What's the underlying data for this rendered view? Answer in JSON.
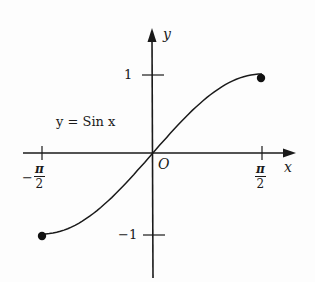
{
  "chart_data": {
    "type": "line",
    "title": "",
    "curve_label": "y = Sin x",
    "xlabel": "x",
    "ylabel": "y",
    "origin_label": "O",
    "x_ticks": [
      {
        "value": -1.5708,
        "label_sign": "−",
        "label_num": "π",
        "label_den": "2"
      },
      {
        "value": 1.5708,
        "label_sign": "",
        "label_num": "π",
        "label_den": "2"
      }
    ],
    "y_ticks": [
      {
        "value": 1,
        "label": "1"
      },
      {
        "value": -1,
        "label": "−1"
      }
    ],
    "series": [
      {
        "name": "y = Sin x",
        "x": [
          -1.5708,
          -1.1781,
          -0.7854,
          -0.3927,
          0,
          0.3927,
          0.7854,
          1.1781,
          1.5708
        ],
        "y": [
          -1,
          -0.9239,
          -0.7071,
          -0.3827,
          0,
          0.3827,
          0.7071,
          0.9239,
          1
        ]
      }
    ],
    "endpoints": [
      {
        "x": -1.5708,
        "y": -1,
        "filled": true
      },
      {
        "x": 1.5708,
        "y": 1,
        "filled": true
      }
    ],
    "xlim": [
      -1.7,
      2.0
    ],
    "ylim": [
      -1.6,
      1.6
    ],
    "grid": false,
    "legend": "none"
  }
}
